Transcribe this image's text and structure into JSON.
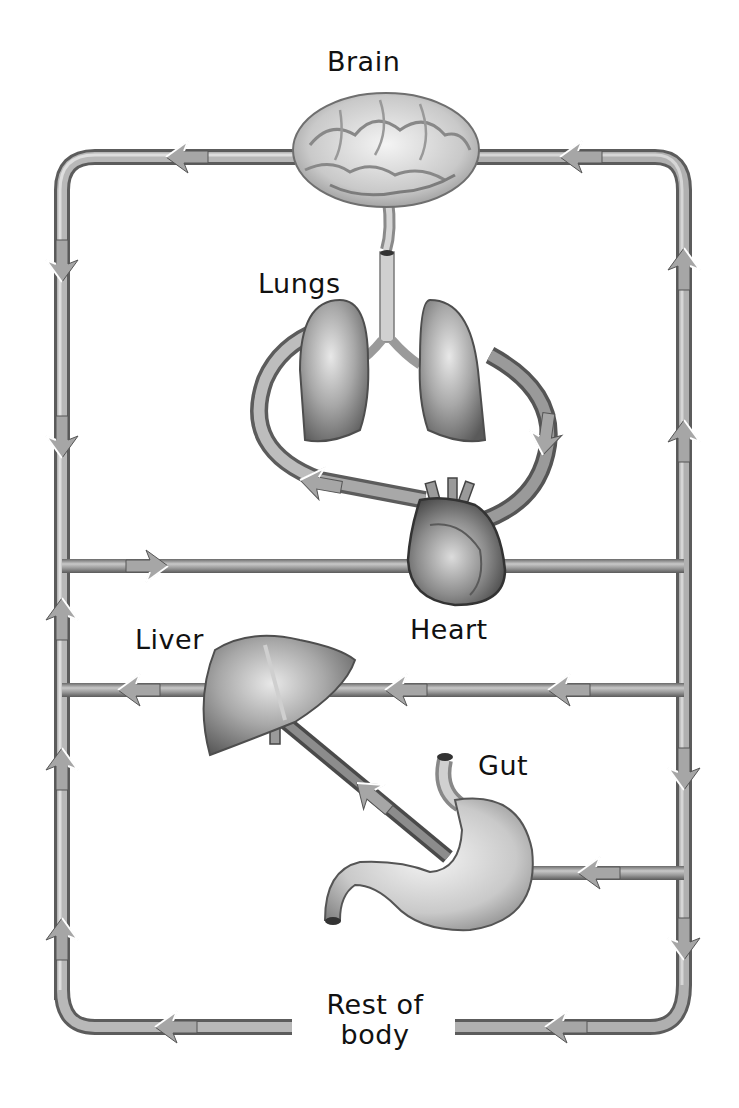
{
  "labels": {
    "brain": "Brain",
    "lungs": "Lungs",
    "heart": "Heart",
    "liver": "Liver",
    "gut": "Gut",
    "rest_line1": "Rest of",
    "rest_line2": "body"
  },
  "colors": {
    "vessel": "#8f8f8f",
    "vessel_dark": "#5e5e5e",
    "vessel_light": "#c4c4c4",
    "organ": "#9a9a9a",
    "organ_light": "#d8d8d8",
    "text": "#111111",
    "background": "#ffffff"
  },
  "flows": [
    {
      "from": "Brain",
      "to": "left side (down)",
      "direction": "left then down"
    },
    {
      "from": "right side (up)",
      "to": "Brain",
      "direction": "up then left"
    },
    {
      "from": "Heart",
      "to": "Lungs",
      "direction": "left arrow into lungs"
    },
    {
      "from": "Lungs",
      "to": "Heart",
      "direction": "down arrow into heart"
    },
    {
      "from": "left side",
      "to": "Heart",
      "direction": "right"
    },
    {
      "from": "Heart",
      "to": "right side",
      "direction": "right"
    },
    {
      "from": "right side",
      "to": "Liver",
      "direction": "left"
    },
    {
      "from": "Liver",
      "to": "left side",
      "direction": "left"
    },
    {
      "from": "Gut",
      "to": "Liver",
      "direction": "diagonal up-left"
    },
    {
      "from": "right side",
      "to": "Gut",
      "direction": "left"
    },
    {
      "from": "right side",
      "to": "Rest of body",
      "direction": "down then left"
    },
    {
      "from": "Rest of body",
      "to": "left side",
      "direction": "left then up"
    }
  ]
}
